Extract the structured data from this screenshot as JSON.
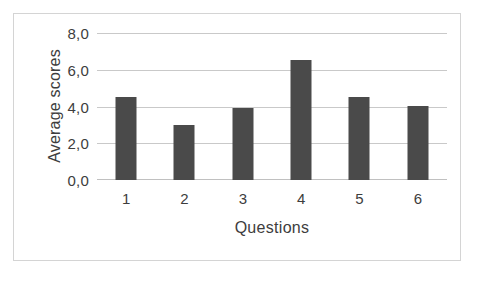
{
  "chart_data": {
    "type": "bar",
    "title": "",
    "subtitle": "",
    "categories": [
      "1",
      "2",
      "3",
      "4",
      "5",
      "6"
    ],
    "values": [
      4.55,
      3.0,
      3.95,
      6.6,
      4.55,
      4.05
    ],
    "series": [
      {
        "name": "Average scores",
        "values": [
          4.55,
          3.0,
          3.95,
          6.6,
          4.55,
          4.05
        ]
      }
    ],
    "xlabel": "Questions",
    "ylabel": "Average scores",
    "ylim": [
      0,
      8
    ],
    "yticks": [
      0,
      2,
      4,
      6,
      8
    ],
    "ytick_labels": [
      "0,0",
      "2,0",
      "4,0",
      "6,0",
      "8,0"
    ],
    "grid": true,
    "grid_axis": "y",
    "legend": false,
    "legend_position": "none",
    "bar_color": "#4a4a4a",
    "gridline_color": "#c9c9c9",
    "background_color": "#ffffff",
    "border_color": "#d4d4d4",
    "text_color": "#3d3d3d",
    "decimal_separator": ","
  }
}
